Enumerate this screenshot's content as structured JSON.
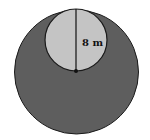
{
  "diagram": {
    "type": "geometry",
    "large_circle": {
      "cx": 76.5,
      "cy": 72,
      "r": 62,
      "fill": "#5e5e5e",
      "stroke": "#1a1a1a"
    },
    "small_circle": {
      "cx": 76,
      "cy": 40,
      "r": 31,
      "fill": "#c4c4c4",
      "stroke": "#1a1a1a"
    },
    "diameter_line": {
      "x1": 76,
      "y1": 9,
      "x2": 76,
      "y2": 71
    },
    "center_dot": {
      "cx": 76,
      "cy": 71,
      "r": 2
    },
    "label": "8 m"
  }
}
